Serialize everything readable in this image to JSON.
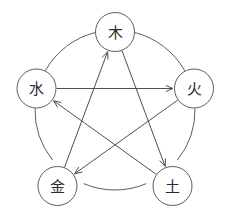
{
  "diagram": {
    "canvas": {
      "width": 228,
      "height": 217,
      "background": "#ffffff"
    },
    "geometry": {
      "outer_circle_center_x": 115,
      "outer_circle_center_y": 110,
      "outer_circle_radius": 80,
      "node_radius": 19.5
    },
    "colors": {
      "stroke": "#5d5d5d",
      "arrow_stroke": "#4f4f4f",
      "node_fill": "#ffffff",
      "label": "#2b2b2b"
    },
    "nodes": [
      {
        "id": "wood",
        "label": "木",
        "cx": 115,
        "cy": 32,
        "position": "top"
      },
      {
        "id": "fire",
        "label": "火",
        "cx": 194,
        "cy": 88.5,
        "position": "right"
      },
      {
        "id": "earth",
        "label": "土",
        "cx": 172.5,
        "cy": 186,
        "position": "bottom-right"
      },
      {
        "id": "metal",
        "label": "金",
        "cx": 57.5,
        "cy": 186,
        "position": "bottom-left"
      },
      {
        "id": "water",
        "label": "水",
        "cx": 36.5,
        "cy": 88.5,
        "position": "left"
      }
    ],
    "outer_arcs": [
      {
        "id": "arc-water-wood",
        "from": "water",
        "to": "wood",
        "arrow": false
      },
      {
        "id": "arc-wood-fire",
        "from": "wood",
        "to": "fire",
        "arrow": false
      },
      {
        "id": "arc-fire-earth",
        "from": "fire",
        "to": "earth",
        "arrow": false
      },
      {
        "id": "arc-earth-metal",
        "from": "earth",
        "to": "metal",
        "arrow": false
      },
      {
        "id": "arc-metal-water",
        "from": "metal",
        "to": "water",
        "arrow": false
      }
    ],
    "inner_arrows": [
      {
        "id": "arrow-water-fire",
        "from": "water",
        "to": "fire"
      },
      {
        "id": "arrow-fire-metal",
        "from": "fire",
        "to": "metal"
      },
      {
        "id": "arrow-metal-wood",
        "from": "metal",
        "to": "wood"
      },
      {
        "id": "arrow-wood-earth",
        "from": "wood",
        "to": "earth"
      },
      {
        "id": "arrow-earth-water",
        "from": "earth",
        "to": "water"
      }
    ]
  }
}
